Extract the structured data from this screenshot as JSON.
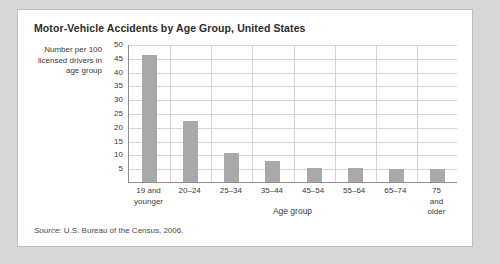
{
  "card": {
    "title": "Motor-Vehicle Accidents by Age Group, United States",
    "source_keyword": "Source:",
    "source_text": "U.S. Bureau of the Census, 2006."
  },
  "colors": {
    "bar_fill": "#a9a9a9",
    "grid": "#d5d5d5",
    "axis": "#8e8e8e",
    "card_background": "#ffffff",
    "page_background": "#d8d8d8",
    "text": "#3a3a3a"
  },
  "chart_data": {
    "type": "bar",
    "title": "Motor-Vehicle Accidents by Age Group, United States",
    "xlabel": "Age group",
    "ylabel": "Number per 100 licensed drivers in age group",
    "ylim": [
      0,
      50
    ],
    "yticks": [
      50,
      45,
      40,
      35,
      30,
      25,
      20,
      15,
      10,
      5
    ],
    "grid": true,
    "legend": "none",
    "categories": [
      "19 and\nyounger",
      "20–24",
      "25–34",
      "35–44",
      "45–54",
      "55–64",
      "65–74",
      "75 and\nolder"
    ],
    "values": [
      46,
      22,
      10.5,
      7.5,
      5,
      5,
      4.8,
      4.8
    ]
  }
}
